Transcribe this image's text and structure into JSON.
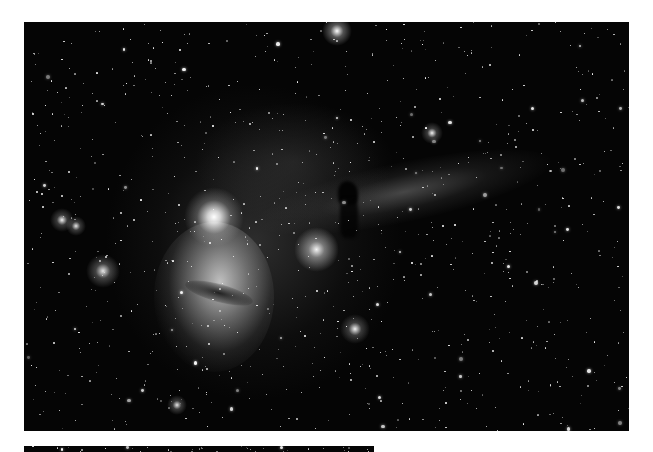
{
  "image": {
    "subject": "Horsehead Nebula and Flame Nebula star field",
    "palette": {
      "sky": "#050505",
      "nebula_glow": "#d8d8d8",
      "star": "#ffffff",
      "border": "#ffffff"
    }
  },
  "features": [
    {
      "name": "flame-nebula",
      "cx": 205,
      "cy": 278
    },
    {
      "name": "alnitak-bright-star",
      "cx": 214,
      "cy": 217
    },
    {
      "name": "horsehead-nebula",
      "cx": 350,
      "cy": 200
    },
    {
      "name": "ic434-emission-band",
      "cx": 420,
      "cy": 185
    },
    {
      "name": "ngc2023-reflection",
      "cx": 316,
      "cy": 250
    }
  ]
}
